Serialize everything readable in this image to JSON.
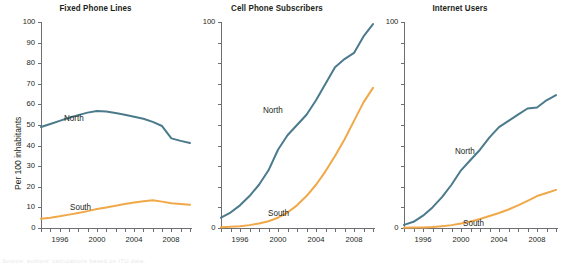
{
  "figure": {
    "width": 574,
    "height": 264,
    "background": "#ffffff",
    "footnote": "Source: authors' calculations based on ITU data."
  },
  "style": {
    "north_color": "#4A7A8C",
    "south_color": "#F0A848",
    "axis_color": "#6d6e71",
    "text_color": "#231f20"
  },
  "axis": {
    "ylabel": "Per 100 inhabitants",
    "y_ticks_full": [
      "0",
      "10",
      "20",
      "30",
      "40",
      "50",
      "60",
      "70",
      "80",
      "90",
      "100"
    ],
    "y_ticks_sparse": [
      "0",
      "100"
    ],
    "x_ticks": [
      "1996",
      "2000",
      "2004",
      "2008"
    ],
    "ylim": [
      0,
      100
    ],
    "xlim": [
      1994,
      2010
    ],
    "grid": false,
    "legend_position": "inline-annotations"
  },
  "chart_data": [
    {
      "type": "line",
      "title": "Fixed Phone Lines",
      "xlabel": "",
      "ylabel": "Per 100 inhabitants",
      "ylim": [
        0,
        100
      ],
      "xlim": [
        1994,
        2010
      ],
      "grid": false,
      "x": [
        1994,
        1995,
        1996,
        1997,
        1998,
        1999,
        2000,
        2001,
        2002,
        2003,
        2004,
        2005,
        2006,
        2007,
        2008,
        2009,
        2010
      ],
      "series": [
        {
          "name": "North",
          "color": "#4A7A8C",
          "values": [
            49.0,
            50.5,
            52.0,
            53.5,
            54.8,
            56.0,
            56.8,
            56.5,
            55.8,
            55.0,
            54.0,
            53.0,
            51.5,
            49.5,
            43.5,
            42.3,
            41.3
          ]
        },
        {
          "name": "South",
          "color": "#F0A848",
          "values": [
            4.5,
            5.0,
            5.7,
            6.5,
            7.3,
            8.2,
            9.2,
            10.0,
            10.8,
            11.6,
            12.4,
            13.0,
            13.5,
            12.8,
            12.0,
            11.6,
            11.3
          ]
        }
      ]
    },
    {
      "type": "line",
      "title": "Cell Phone Subscribers",
      "xlabel": "",
      "ylabel": "",
      "ylim": [
        0,
        100
      ],
      "xlim": [
        1994,
        2010
      ],
      "grid": false,
      "x": [
        1994,
        1995,
        1996,
        1997,
        1998,
        1999,
        2000,
        2001,
        2002,
        2003,
        2004,
        2005,
        2006,
        2007,
        2008,
        2009,
        2010
      ],
      "series": [
        {
          "name": "North",
          "color": "#4A7A8C",
          "values": [
            5.0,
            7.5,
            11.0,
            15.5,
            21.0,
            28.0,
            38.0,
            45.0,
            50.0,
            55.0,
            62.0,
            70.0,
            78.0,
            82.0,
            85.0,
            93.0,
            99.0
          ]
        },
        {
          "name": "South",
          "color": "#F0A848",
          "values": [
            0.4,
            0.6,
            0.9,
            1.4,
            2.2,
            3.3,
            5.0,
            7.5,
            11.0,
            15.5,
            21.0,
            27.5,
            35.0,
            43.0,
            52.0,
            61.0,
            68.0
          ]
        }
      ]
    },
    {
      "type": "line",
      "title": "Internet Users",
      "xlabel": "",
      "ylabel": "",
      "ylim": [
        0,
        100
      ],
      "xlim": [
        1994,
        2010
      ],
      "grid": false,
      "x": [
        1994,
        1995,
        1996,
        1997,
        1998,
        1999,
        2000,
        2001,
        2002,
        2003,
        2004,
        2005,
        2006,
        2007,
        2008,
        2009,
        2010
      ],
      "series": [
        {
          "name": "North",
          "color": "#4A7A8C",
          "values": [
            1.5,
            3.0,
            6.0,
            10.0,
            15.0,
            21.0,
            28.0,
            33.0,
            38.0,
            44.0,
            49.0,
            52.0,
            55.0,
            58.0,
            58.5,
            62.0,
            64.5
          ]
        },
        {
          "name": "South",
          "color": "#F0A848",
          "values": [
            0.1,
            0.2,
            0.3,
            0.5,
            0.9,
            1.4,
            2.2,
            3.2,
            4.4,
            5.8,
            7.3,
            9.0,
            11.0,
            13.2,
            15.5,
            17.0,
            18.5
          ]
        }
      ]
    }
  ]
}
